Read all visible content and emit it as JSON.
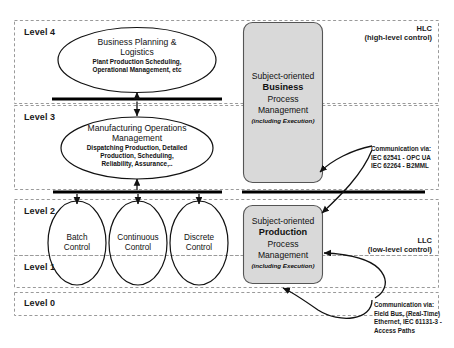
{
  "diagram": {
    "levels": [
      {
        "key": "level4",
        "label": "Level 4"
      },
      {
        "key": "level3",
        "label": "Level 3"
      },
      {
        "key": "level2",
        "label": "Level 2"
      },
      {
        "key": "level1",
        "label": "Level 1"
      },
      {
        "key": "level0",
        "label": "Level 0"
      }
    ],
    "zone_labels": {
      "hlc_abbrev": "HLC",
      "hlc_full": "(high-level control)",
      "llc_abbrev": "LLC",
      "llc_full": "(low-level control)"
    },
    "ellipses": [
      {
        "key": "business-planning",
        "title_line1": "Business Planning &",
        "title_line2": "Logistics",
        "sub_line1": "Plant Production Scheduling,",
        "sub_line2": "Operational Management, etc"
      },
      {
        "key": "manufacturing-operations",
        "title_line1": "Manufacturing Operations",
        "title_line2": "Management",
        "sub_line1": "Dispatching Production, Detailed",
        "sub_line2": "Production, Scheduling,",
        "sub_line3": "Reliability, Assurance,.."
      }
    ],
    "control_ellipses": [
      {
        "key": "batch-control",
        "line1": "Batch",
        "line2": "Control"
      },
      {
        "key": "continuous-control",
        "line1": "Continuous",
        "line2": "Control"
      },
      {
        "key": "discrete-control",
        "line1": "Discrete",
        "line2": "Control"
      }
    ],
    "gray_boxes": [
      {
        "key": "business-process-management",
        "line1": "Subject-oriented",
        "line2": "Business",
        "line3": "Process",
        "line4": "Management",
        "note": "(including Execution)"
      },
      {
        "key": "production-process-management",
        "line1": "Subject-oriented",
        "line2": "Production",
        "line3": "Process",
        "line4": "Management",
        "note": "(including Execution)"
      }
    ],
    "communications": [
      {
        "key": "high-level-communication",
        "line1": "Communication via:",
        "line2": "IEC 62541 - OPC UA",
        "line3": "IEC 62264 - B2MML"
      },
      {
        "key": "low-level-communication",
        "line1": "Communication via:",
        "line2": "Field Bus, (Real-Time)",
        "line3": "Ethernet, IEC 61131-3 -",
        "line4": "Access Paths"
      }
    ],
    "colors": {
      "background": "#ffffff",
      "stroke": "#111111",
      "dashed_border": "#9a9a9a",
      "gray_box_fill": "#d9d9d9",
      "gray_box_stroke": "#555555",
      "bus_bar": "#000000",
      "text": "#111111"
    }
  }
}
